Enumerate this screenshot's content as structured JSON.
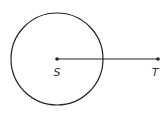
{
  "diagram": {
    "circle": {
      "cx": 57,
      "cy": 59,
      "r": 46,
      "stroke": "#222222"
    },
    "segment": {
      "x1": 57,
      "y1": 59,
      "x2": 158,
      "y2": 59,
      "stroke": "#222222"
    },
    "points": [
      {
        "label": "S",
        "x": 57,
        "y": 59,
        "label_x": 57,
        "label_y": 76
      },
      {
        "label": "T",
        "x": 158,
        "y": 59,
        "label_x": 155,
        "label_y": 76
      }
    ]
  }
}
